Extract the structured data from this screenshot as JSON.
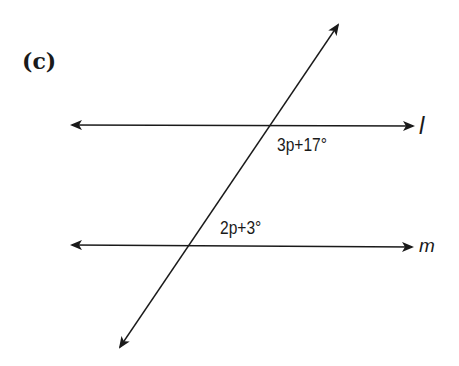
{
  "figure": {
    "part_label": "(c)",
    "lines": [
      {
        "name": "l",
        "label": "l",
        "y": 125
      },
      {
        "name": "m",
        "label": "m",
        "y": 246
      }
    ],
    "transversal": {
      "from": [
        338,
        25
      ],
      "to": [
        120,
        347
      ]
    },
    "angles": [
      {
        "at_line": "l",
        "expression": "3p+17°",
        "position": "below-right"
      },
      {
        "at_line": "m",
        "expression": "2p+3°",
        "position": "above-right"
      }
    ]
  }
}
